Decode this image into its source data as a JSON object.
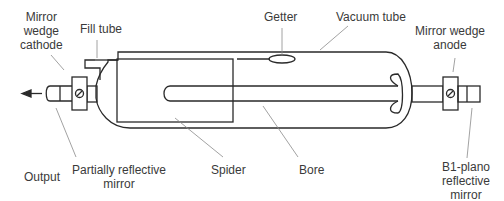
{
  "diagram": {
    "title": "",
    "type": "laser tube cross-section",
    "labels": {
      "mirror_cathode": [
        "Mirror",
        "wedge",
        "cathode"
      ],
      "fill_tube": "Fill tube",
      "getter": "Getter",
      "vacuum_tube": "Vacuum tube",
      "mirror_anode": [
        "Mirror wedge",
        "anode"
      ],
      "output": "Output",
      "partial_mirror": [
        "Partially reflective",
        "mirror"
      ],
      "spider": "Spider",
      "bore": "Bore",
      "b1_mirror": [
        "B1-plano",
        "reflective",
        "mirror"
      ]
    },
    "colors": {
      "stroke": "#2a2a2a",
      "leader": "#8a8a8a",
      "background": "#ffffff"
    }
  }
}
